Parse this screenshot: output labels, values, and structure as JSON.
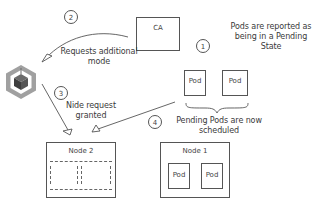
{
  "diagram": {
    "steps": [
      {
        "number": "1",
        "label": "Pods are reported as being in a Pending State"
      },
      {
        "number": "2",
        "label": "Requests additional mode"
      },
      {
        "number": "3",
        "label": "Nide request granted"
      },
      {
        "number": "4",
        "label": "Pending Pods are now scheduled"
      }
    ],
    "ca_box": {
      "label": "CA"
    },
    "pending_pods": [
      {
        "label": "Pod"
      },
      {
        "label": "Pod"
      }
    ],
    "node2": {
      "label": "Node 2"
    },
    "node1": {
      "label": "Node 1",
      "pods": [
        {
          "label": "Pod"
        },
        {
          "label": "Pod"
        }
      ]
    },
    "icon": {
      "name": "cloud-provider-cube-icon"
    },
    "colors": {
      "stroke": "#555555",
      "icon_outer": "#9a9a9a",
      "icon_inner": "#4a4a4a"
    }
  }
}
